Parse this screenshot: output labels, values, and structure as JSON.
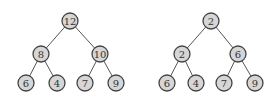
{
  "diagram": {
    "node_radius": 8,
    "colors": {
      "fill": "#d6d6d6",
      "stroke": "#444444",
      "edge": "#555555",
      "text": "#333333"
    },
    "trees": [
      {
        "name": "left-tree",
        "nodes": [
          {
            "id": "l0",
            "label": "12",
            "x": 70,
            "y": 21
          },
          {
            "id": "l1",
            "label": "8",
            "x": 41,
            "y": 54
          },
          {
            "id": "l2",
            "label": "10",
            "x": 100,
            "y": 54
          },
          {
            "id": "l3",
            "label": "6",
            "x": 26,
            "y": 83
          },
          {
            "id": "l4",
            "label": "4",
            "x": 57,
            "y": 83
          },
          {
            "id": "l5",
            "label": "7",
            "x": 85,
            "y": 83
          },
          {
            "id": "l6",
            "label": "9",
            "x": 116,
            "y": 83
          }
        ],
        "edges": [
          [
            "l0",
            "l1"
          ],
          [
            "l0",
            "l2"
          ],
          [
            "l1",
            "l3"
          ],
          [
            "l1",
            "l4"
          ],
          [
            "l2",
            "l5"
          ],
          [
            "l2",
            "l6"
          ]
        ]
      },
      {
        "name": "right-tree",
        "nodes": [
          {
            "id": "r0",
            "label": "2",
            "x": 211,
            "y": 21
          },
          {
            "id": "r1",
            "label": "2",
            "x": 182,
            "y": 54
          },
          {
            "id": "r2",
            "label": "6",
            "x": 238,
            "y": 54
          },
          {
            "id": "r3",
            "label": "6",
            "x": 167,
            "y": 83
          },
          {
            "id": "r4",
            "label": "4",
            "x": 196,
            "y": 83
          },
          {
            "id": "r5",
            "label": "7",
            "x": 224,
            "y": 83
          },
          {
            "id": "r6",
            "label": "9",
            "x": 255,
            "y": 83
          }
        ],
        "edges": [
          [
            "r0",
            "r1"
          ],
          [
            "r0",
            "r2"
          ],
          [
            "r1",
            "r3"
          ],
          [
            "r1",
            "r4"
          ],
          [
            "r2",
            "r5"
          ],
          [
            "r2",
            "r6"
          ]
        ]
      }
    ]
  }
}
